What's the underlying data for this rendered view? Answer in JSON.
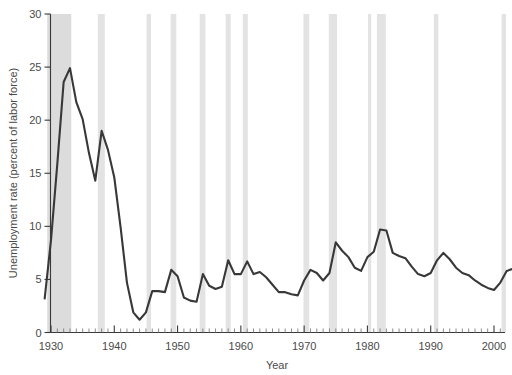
{
  "chart_data": {
    "type": "line",
    "title": "",
    "subtitle": "",
    "xlabel": "Year",
    "ylabel": "Unemployment rate (percent of labor force)",
    "xlim": [
      1929,
      2003
    ],
    "ylim": [
      0,
      30
    ],
    "grid": false,
    "legend": null,
    "x_ticks_major": [
      1930,
      1940,
      1950,
      1960,
      1970,
      1980,
      1990,
      2000
    ],
    "x_tick_labels": [
      "1930",
      "1940",
      "1950",
      "1960",
      "1970",
      "1980",
      "1990",
      "2000"
    ],
    "x_minor_tick_interval": 1,
    "y_ticks": [
      0,
      5,
      10,
      15,
      20,
      25,
      30
    ],
    "y_tick_labels": [
      "0",
      "5",
      "10",
      "15",
      "20",
      "25",
      "30"
    ],
    "series": [
      {
        "name": "Unemployment rate",
        "color": "#383838",
        "x": [
          1929,
          1930,
          1931,
          1932,
          1933,
          1934,
          1935,
          1936,
          1937,
          1938,
          1939,
          1940,
          1941,
          1942,
          1943,
          1944,
          1945,
          1946,
          1947,
          1948,
          1949,
          1950,
          1951,
          1952,
          1953,
          1954,
          1955,
          1956,
          1957,
          1958,
          1959,
          1960,
          1961,
          1962,
          1963,
          1964,
          1965,
          1966,
          1967,
          1968,
          1969,
          1970,
          1971,
          1972,
          1973,
          1974,
          1975,
          1976,
          1977,
          1978,
          1979,
          1980,
          1981,
          1982,
          1983,
          1984,
          1985,
          1986,
          1987,
          1988,
          1989,
          1990,
          1991,
          1992,
          1993,
          1994,
          1995,
          1996,
          1997,
          1998,
          1999,
          2000,
          2001,
          2002,
          2003
        ],
        "values": [
          3.2,
          8.7,
          15.9,
          23.6,
          24.9,
          21.7,
          20.1,
          16.9,
          14.3,
          19.0,
          17.2,
          14.6,
          9.9,
          4.7,
          1.9,
          1.2,
          1.9,
          3.9,
          3.9,
          3.8,
          5.9,
          5.3,
          3.3,
          3.0,
          2.9,
          5.5,
          4.4,
          4.1,
          4.3,
          6.8,
          5.5,
          5.5,
          6.7,
          5.5,
          5.7,
          5.2,
          4.5,
          3.8,
          3.8,
          3.6,
          3.5,
          4.9,
          5.9,
          5.6,
          4.9,
          5.6,
          8.5,
          7.7,
          7.1,
          6.1,
          5.8,
          7.1,
          7.6,
          9.7,
          9.6,
          7.5,
          7.2,
          7.0,
          6.2,
          5.5,
          5.3,
          5.6,
          6.8,
          7.5,
          6.9,
          6.1,
          5.6,
          5.4,
          4.9,
          4.5,
          4.2,
          4.0,
          4.7,
          5.8,
          6.0
        ]
      }
    ],
    "shaded_bands": {
      "name": "recessions",
      "color": "#e3e3e3",
      "ranges": [
        [
          1929.4,
          1933.2
        ],
        [
          1937.4,
          1938.5
        ],
        [
          1945.1,
          1945.8
        ],
        [
          1948.9,
          1949.8
        ],
        [
          1953.5,
          1954.4
        ],
        [
          1957.6,
          1958.4
        ],
        [
          1960.3,
          1961.1
        ],
        [
          1969.9,
          1970.8
        ],
        [
          1973.9,
          1975.2
        ],
        [
          1980.1,
          1980.6
        ],
        [
          1981.5,
          1982.9
        ],
        [
          1990.5,
          1991.2
        ],
        [
          2001.2,
          2001.9
        ]
      ]
    }
  },
  "axis": {
    "x_title": "Year",
    "y_title": "Unemployment rate (percent of labor force)"
  }
}
